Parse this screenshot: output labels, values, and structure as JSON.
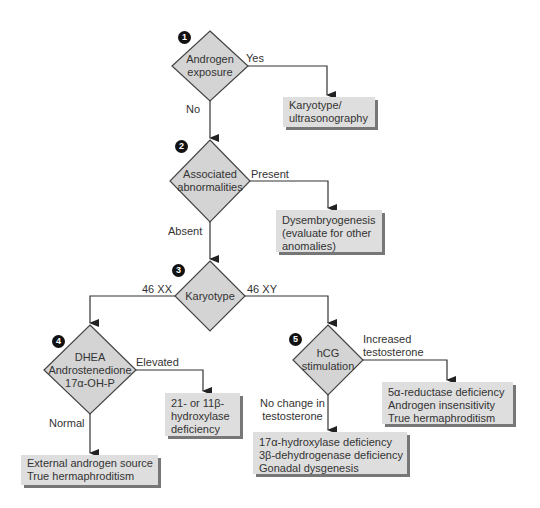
{
  "colors": {
    "diamond_fill": "#d4d4d4",
    "box_fill": "#dedede",
    "shadow": "#777777",
    "line": "#333333"
  },
  "nodes": {
    "d1": {
      "step": "1",
      "lines": [
        "Androgen",
        "exposure"
      ]
    },
    "d2": {
      "step": "2",
      "lines": [
        "Associated",
        "abnormalities"
      ]
    },
    "d3": {
      "step": "3",
      "lines": [
        "Karyotype"
      ]
    },
    "d4": {
      "step": "4",
      "lines": [
        "DHEA",
        "Androstenedione",
        "17α-OH-P"
      ]
    },
    "d5": {
      "step": "5",
      "lines": [
        "hCG",
        "stimulation"
      ]
    }
  },
  "boxes": {
    "b1": [
      "Karyotype/",
      "ultrasonography"
    ],
    "b2": [
      "Dysembryogenesis",
      "(evaluate for other",
      "anomalies)"
    ],
    "b4a": [
      "21- or 11β-",
      "hydroxylase",
      "deficiency"
    ],
    "b4b": [
      "External androgen source",
      "True hermaphroditism"
    ],
    "b5a": [
      "5α-reductase deficiency",
      "Androgen insensitivity",
      "True hermaphroditism"
    ],
    "b5b": [
      "17α-hydroxylase deficiency",
      "3β-dehydrogenase deficiency",
      "Gonadal dysgenesis"
    ]
  },
  "edges": {
    "yes": "Yes",
    "no": "No",
    "present": "Present",
    "absent": "Absent",
    "xx": "46 XX",
    "xy": "46 XY",
    "elevated": "Elevated",
    "normal": "Normal",
    "increased": [
      "Increased",
      "testosterone"
    ],
    "nochange": [
      "No change in",
      "testosterone"
    ]
  }
}
